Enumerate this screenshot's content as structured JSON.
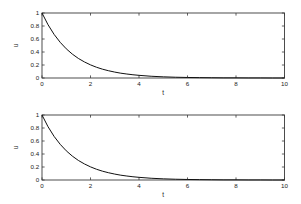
{
  "figure": {
    "background": "#ffffff",
    "axes_color": "#3a3a3a",
    "curve_color": "#111111"
  },
  "chart_data": [
    {
      "type": "line",
      "title": "",
      "xlabel": "t",
      "ylabel": "u",
      "xlim": [
        0,
        10
      ],
      "ylim": [
        0,
        1
      ],
      "xticks": [
        0,
        2,
        4,
        6,
        8,
        10
      ],
      "xtick_labels": [
        "0",
        "2",
        "4",
        "6",
        "8",
        "10"
      ],
      "yticks": [
        0,
        0.2,
        0.4,
        0.6,
        0.8,
        1
      ],
      "ytick_labels": [
        "0",
        "0.2",
        "0.4",
        "0.6",
        "0.8",
        "1"
      ],
      "grid": false,
      "legend": null,
      "series": [
        {
          "name": "u(t)",
          "x": [
            0,
            0.25,
            0.5,
            0.75,
            1,
            1.25,
            1.5,
            1.75,
            2,
            2.25,
            2.5,
            2.75,
            3,
            3.25,
            3.5,
            3.75,
            4,
            4.5,
            5,
            5.5,
            6,
            6.5,
            7,
            7.5,
            8,
            8.5,
            9,
            9.5,
            10
          ],
          "y": [
            1,
            0.819,
            0.67,
            0.549,
            0.449,
            0.368,
            0.301,
            0.247,
            0.202,
            0.165,
            0.135,
            0.111,
            0.091,
            0.074,
            0.061,
            0.05,
            0.041,
            0.027,
            0.018,
            0.012,
            0.008,
            0.006,
            0.004,
            0.002,
            0.002,
            0.001,
            0.001,
            0.0,
            0.0
          ]
        }
      ]
    },
    {
      "type": "line",
      "title": "",
      "xlabel": "t",
      "ylabel": "u",
      "xlim": [
        0,
        10
      ],
      "ylim": [
        0,
        1
      ],
      "xticks": [
        0,
        2,
        4,
        6,
        8,
        10
      ],
      "xtick_labels": [
        "0",
        "2",
        "4",
        "6",
        "8",
        "10"
      ],
      "yticks": [
        0,
        0.2,
        0.4,
        0.6,
        0.8,
        1
      ],
      "ytick_labels": [
        "0",
        "0.2",
        "0.4",
        "0.6",
        "0.8",
        "1"
      ],
      "grid": false,
      "legend": null,
      "series": [
        {
          "name": "u(t)",
          "x": [
            0,
            0.25,
            0.5,
            0.75,
            1,
            1.25,
            1.5,
            1.75,
            2,
            2.25,
            2.5,
            2.75,
            3,
            3.25,
            3.5,
            3.75,
            4,
            4.5,
            5,
            5.5,
            6,
            6.5,
            7,
            7.5,
            8,
            8.5,
            9,
            9.5,
            10
          ],
          "y": [
            1,
            0.819,
            0.67,
            0.549,
            0.449,
            0.368,
            0.301,
            0.247,
            0.202,
            0.165,
            0.135,
            0.111,
            0.091,
            0.074,
            0.061,
            0.05,
            0.041,
            0.027,
            0.018,
            0.012,
            0.008,
            0.006,
            0.004,
            0.002,
            0.002,
            0.001,
            0.001,
            0.0,
            0.0
          ]
        }
      ]
    }
  ]
}
